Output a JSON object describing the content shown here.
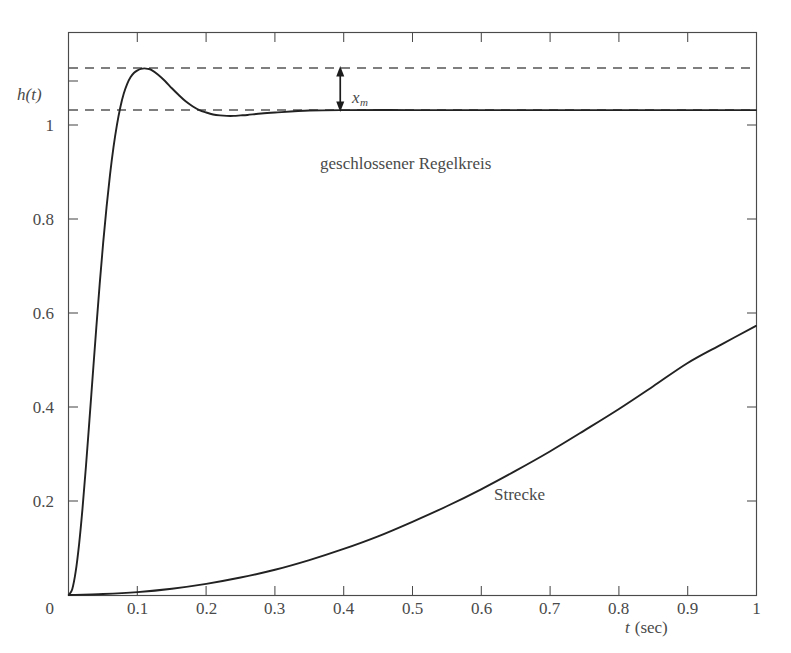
{
  "figure": {
    "background": "#ffffff",
    "frame_color": "#4a4a4a",
    "curve_color": "#222222",
    "dash_color": "#555555"
  },
  "chart_data": {
    "type": "line",
    "title": "",
    "xlabel": "t (sec)",
    "ylabel": "h(t)",
    "xlim": [
      0,
      1
    ],
    "ylim": [
      0,
      1.16
    ],
    "grid": false,
    "legend_position": "inline-annotations",
    "xticks": [
      0,
      0.1,
      0.2,
      0.3,
      0.4,
      0.5,
      0.6,
      0.7,
      0.8,
      0.9,
      1
    ],
    "xtick_labels": [
      "0",
      "0.1",
      "0.2",
      "0.3",
      "0.4",
      "0.5",
      "0.6",
      "0.7",
      "0.8",
      "0.9",
      "1"
    ],
    "yticks": [
      0,
      0.2,
      0.4,
      0.6,
      0.8,
      1
    ],
    "ytick_labels": [
      "0",
      "0.2",
      "0.4",
      "0.6",
      "0.8",
      "1"
    ],
    "reference_lines": [
      {
        "name": "steady-state",
        "y": 1.0,
        "style": "dashed"
      },
      {
        "name": "overshoot-peak",
        "y": 1.087,
        "style": "dashed"
      }
    ],
    "annotations": [
      {
        "name": "overshoot-measure",
        "label": "x",
        "sublabel": "m",
        "x": 0.395,
        "y_from": 1.0,
        "y_to": 1.087,
        "arrow": "double"
      },
      {
        "name": "closed-loop-label",
        "label": "geschlossener Regelkreis",
        "x": 0.6,
        "y": 0.69
      },
      {
        "name": "plant-label",
        "label": "Strecke",
        "x": 0.72,
        "y": 0.22
      }
    ],
    "series": [
      {
        "name": "geschlossener Regelkreis",
        "x": [
          0,
          0.005,
          0.01,
          0.015,
          0.02,
          0.025,
          0.03,
          0.035,
          0.04,
          0.045,
          0.05,
          0.055,
          0.06,
          0.065,
          0.07,
          0.075,
          0.08,
          0.085,
          0.09,
          0.095,
          0.1,
          0.105,
          0.11,
          0.115,
          0.12,
          0.13,
          0.14,
          0.15,
          0.16,
          0.17,
          0.18,
          0.19,
          0.2,
          0.21,
          0.22,
          0.23,
          0.24,
          0.25,
          0.26,
          0.28,
          0.3,
          0.35,
          0.4,
          0.5,
          0.6,
          0.7,
          0.8,
          0.9,
          1.0
        ],
        "y": [
          0,
          0.012,
          0.048,
          0.105,
          0.179,
          0.266,
          0.36,
          0.456,
          0.551,
          0.642,
          0.726,
          0.801,
          0.867,
          0.923,
          0.969,
          1.006,
          1.034,
          1.054,
          1.068,
          1.077,
          1.082,
          1.085,
          1.086,
          1.085,
          1.083,
          1.073,
          1.06,
          1.045,
          1.031,
          1.018,
          1.008,
          1.0,
          0.995,
          0.991,
          0.989,
          0.988,
          0.988,
          0.989,
          0.99,
          0.993,
          0.995,
          0.999,
          1.0,
          1.0,
          1.0,
          1.0,
          1.0,
          1.0,
          1.0
        ]
      },
      {
        "name": "Strecke",
        "x": [
          0,
          0.05,
          0.1,
          0.15,
          0.2,
          0.25,
          0.3,
          0.35,
          0.4,
          0.45,
          0.5,
          0.55,
          0.6,
          0.65,
          0.7,
          0.75,
          0.8,
          0.85,
          0.9,
          0.95,
          1.0
        ],
        "y": [
          0,
          0.002,
          0.006,
          0.013,
          0.023,
          0.036,
          0.052,
          0.072,
          0.095,
          0.121,
          0.151,
          0.183,
          0.218,
          0.256,
          0.296,
          0.339,
          0.383,
          0.43,
          0.478,
          0.517,
          0.555
        ]
      }
    ]
  },
  "axes": {
    "y_axis_label": "h(t)",
    "x_axis_label_var": "t",
    "x_axis_label_unit": "(sec)",
    "x_tick_labels": [
      "0",
      "0.1",
      "0.2",
      "0.3",
      "0.4",
      "0.5",
      "0.6",
      "0.7",
      "0.8",
      "0.9",
      "1"
    ],
    "y_tick_labels": [
      "0",
      "0.2",
      "0.4",
      "0.6",
      "0.8",
      "1"
    ]
  },
  "labels": {
    "closed_loop": "geschlossener Regelkreis",
    "plant": "Strecke",
    "overshoot_var": "x",
    "overshoot_sub": "m"
  }
}
